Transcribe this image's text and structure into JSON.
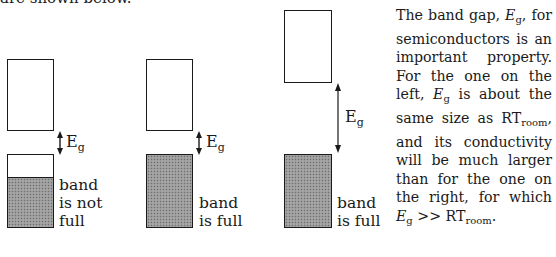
{
  "header_fragment": "are shown below.",
  "diagrams": [
    {
      "id": "left",
      "gap_label": "E",
      "gap_sub": "g",
      "band_label_lines": [
        "band",
        "is not",
        "full"
      ]
    },
    {
      "id": "middle",
      "gap_label": "E",
      "gap_sub": "g",
      "band_label_lines": [
        "band",
        "is full"
      ]
    },
    {
      "id": "right",
      "gap_label": "E",
      "gap_sub": "g",
      "band_label_lines": [
        "band",
        "is full"
      ]
    }
  ],
  "paragraph": {
    "t1": "The band gap, ",
    "eg1": "E",
    "eg1_sub": "g",
    "t2": ", for semiconductors is an important property. For the one on the left, ",
    "eg2": "E",
    "eg2_sub": "g",
    "t3": " is about the same size as RT",
    "rt1_sub": "room",
    "t4": ", and its conductivity will be much larger than for the one on the right, for which ",
    "eg3": "E",
    "eg3_sub": "g",
    "t5": " >> RT",
    "rt2_sub": "room",
    "t6": "."
  },
  "colors": {
    "ink": "#1a1a1a",
    "band_fill": "#9a9a9a"
  }
}
